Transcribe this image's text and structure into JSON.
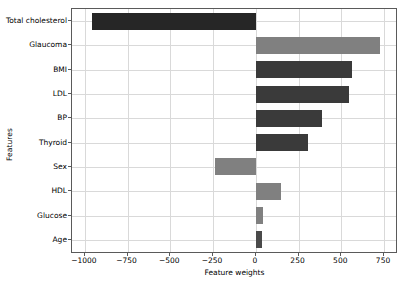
{
  "chart_data": {
    "type": "bar",
    "orientation": "horizontal",
    "title": "",
    "xlabel": "Feature weights",
    "ylabel": "Features",
    "categories": [
      "Total cholesterol",
      "Glaucoma",
      "BMI",
      "LDL",
      "BP",
      "Thyroid",
      "Sex",
      "HDL",
      "Glucose",
      "Age"
    ],
    "values": [
      -960,
      725,
      560,
      545,
      385,
      305,
      -240,
      150,
      40,
      35
    ],
    "colors": [
      "#262626",
      "#808080",
      "#3a3a3a",
      "#3a3a3a",
      "#3a3a3a",
      "#3a3a3a",
      "#808080",
      "#808080",
      "#808080",
      "#4a4a4a"
    ],
    "xlim": [
      -1075,
      820
    ],
    "xticks": [
      -1000,
      -750,
      -500,
      -250,
      0,
      250,
      500,
      750
    ],
    "xticklabels": [
      "−1000",
      "−750",
      "−500",
      "−250",
      "0",
      "250",
      "500",
      "750"
    ],
    "grid": "both",
    "legend": null
  }
}
